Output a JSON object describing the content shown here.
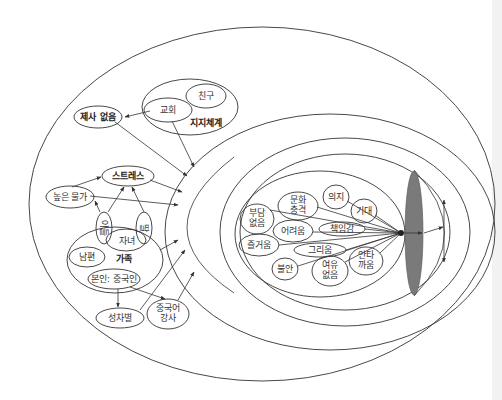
{
  "diagram": {
    "type": "nested-ellipse conceptual diagram",
    "outer_region": {
      "support_system": {
        "group_label": "지지체계",
        "nodes": [
          "친구",
          "교회"
        ]
      },
      "nodes": {
        "no_ancestral_rites": "제사 없음",
        "stress": "스트레스",
        "high_prices": "높은 물가",
        "son": "아들",
        "daughter": "딸",
        "children": "자녀",
        "husband": "남편",
        "family_label": "가족",
        "self_chinese": "본인: 중국인",
        "discrimination": "성차별",
        "chinese_teacher": "중국어 강사"
      }
    },
    "inner_region": {
      "nodes": {
        "no_burden": "부담 없음",
        "culture_shock": "문화 충격",
        "will": "의지",
        "expectation": "기대",
        "difficulty": "어려움",
        "responsibility": "책임감",
        "enjoyment": "즐거움",
        "longing": "그리움",
        "anxiety": "불안",
        "no_leisure": "여유 없음",
        "frustration": "안타까움"
      }
    }
  },
  "colors": {
    "line": "#333333",
    "focus_ellipse": "#7a7a7a",
    "background": "#ffffff"
  }
}
